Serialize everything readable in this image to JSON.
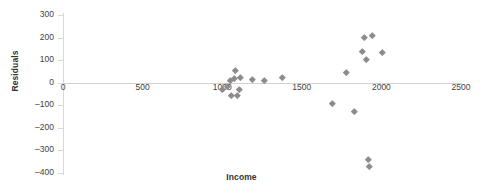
{
  "chart_data": {
    "type": "scatter",
    "title": "",
    "xlabel": "Income",
    "ylabel": "Residuals",
    "xlim": [
      0,
      2500
    ],
    "ylim": [
      -400,
      300
    ],
    "xticks": [
      0,
      500,
      1000,
      1500,
      2000,
      2500
    ],
    "yticks": [
      -400,
      -300,
      -200,
      -100,
      0,
      100,
      200,
      300
    ],
    "grid": false,
    "legend": false,
    "marker": "diamond",
    "marker_color": "#8c8c8c",
    "series": [
      {
        "name": "Residuals",
        "points": [
          {
            "x": 1000,
            "y": -30
          },
          {
            "x": 1035,
            "y": -15
          },
          {
            "x": 1050,
            "y": 10
          },
          {
            "x": 1060,
            "y": -55
          },
          {
            "x": 1075,
            "y": 18
          },
          {
            "x": 1085,
            "y": 57
          },
          {
            "x": 1095,
            "y": -55
          },
          {
            "x": 1110,
            "y": -28
          },
          {
            "x": 1115,
            "y": 24
          },
          {
            "x": 1190,
            "y": 16
          },
          {
            "x": 1265,
            "y": 11
          },
          {
            "x": 1375,
            "y": 24
          },
          {
            "x": 1690,
            "y": -92
          },
          {
            "x": 1780,
            "y": 46
          },
          {
            "x": 1830,
            "y": -128
          },
          {
            "x": 1880,
            "y": 140
          },
          {
            "x": 1895,
            "y": 200
          },
          {
            "x": 1905,
            "y": 105
          },
          {
            "x": 1920,
            "y": -340
          },
          {
            "x": 1925,
            "y": -370
          },
          {
            "x": 1945,
            "y": 212
          },
          {
            "x": 2005,
            "y": 136
          }
        ]
      }
    ]
  },
  "axes": {
    "y_tick_labels": [
      "300",
      "200",
      "100",
      "0",
      "-100",
      "-200",
      "-300",
      "-400"
    ],
    "x_tick_labels": [
      "0",
      "500",
      "1000",
      "1500",
      "2000",
      "2500"
    ],
    "x_title": "Income",
    "y_title": "Residuals"
  }
}
